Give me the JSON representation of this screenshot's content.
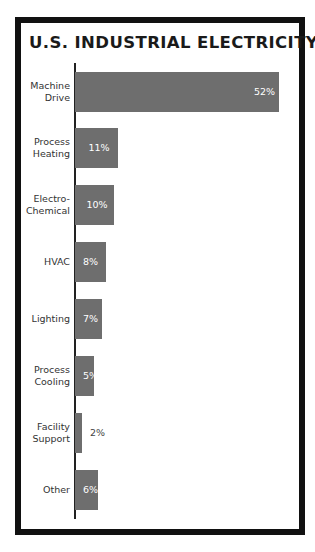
{
  "chart_data": {
    "type": "bar",
    "orientation": "horizontal",
    "title": "U.S. INDUSTRIAL ELECTRICITY USE",
    "xlabel": "",
    "ylabel": "",
    "unit": "%",
    "categories": [
      "Machine Drive",
      "Process Heating",
      "Electro-Chemical",
      "HVAC",
      "Lighting",
      "Process Cooling",
      "Facility Support",
      "Other"
    ],
    "values": [
      52,
      11,
      10,
      8,
      7,
      5,
      2,
      6
    ],
    "value_labels": [
      "52%",
      "11%",
      "10%",
      "8%",
      "7%",
      "5%",
      "2%",
      "6%"
    ],
    "bar_color": "#6e6e6e",
    "grid": false,
    "legend": null
  },
  "title": "U.S. INDUSTRIAL ELECTRICITY USE",
  "rows": [
    {
      "line1": "Machine",
      "line2": "Drive",
      "value": "52%",
      "width": 204,
      "outside": false
    },
    {
      "line1": "Process",
      "line2": "Heating",
      "value": "11%",
      "width": 43,
      "outside": false
    },
    {
      "line1": "Electro-",
      "line2": "Chemical",
      "value": "10%",
      "width": 39,
      "outside": false
    },
    {
      "line1": "HVAC",
      "line2": "",
      "value": "8%",
      "width": 31,
      "outside": false
    },
    {
      "line1": "Lighting",
      "line2": "",
      "value": "7%",
      "width": 27,
      "outside": false
    },
    {
      "line1": "Process",
      "line2": "Cooling",
      "value": "5%",
      "width": 19,
      "outside": false
    },
    {
      "line1": "Facility",
      "line2": "Support",
      "value": "2%",
      "width": 7,
      "outside": true
    },
    {
      "line1": "Other",
      "line2": "",
      "value": "6%",
      "width": 23,
      "outside": false
    }
  ]
}
